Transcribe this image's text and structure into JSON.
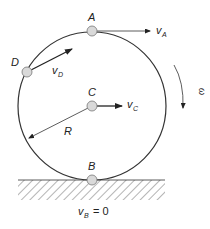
{
  "diagram": {
    "points": {
      "A": {
        "label": "A"
      },
      "B": {
        "label": "B"
      },
      "C": {
        "label": "C"
      },
      "D": {
        "label": "D"
      }
    },
    "velocities": {
      "vA": {
        "symbol": "v",
        "sub": "A"
      },
      "vC": {
        "symbol": "v",
        "sub": "C"
      },
      "vD": {
        "symbol": "v",
        "sub": "D"
      },
      "vB": {
        "symbol": "v",
        "sub": "B",
        "eq": "= 0"
      }
    },
    "radius_label": "R",
    "omega_label": "ω",
    "colors": {
      "line": "#333333",
      "point_fill": "#d9d9d9",
      "point_stroke": "#777777"
    }
  }
}
